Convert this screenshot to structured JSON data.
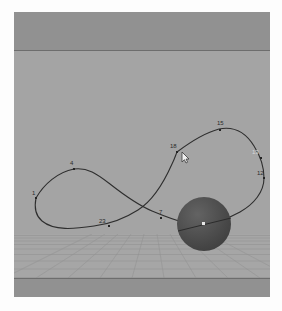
{
  "app": {
    "title": "3D Viewport",
    "view_label": "User Perspective"
  },
  "viewport": {
    "background_color": "#a4a4a4",
    "band_color": "#919191",
    "ground_color": "#a6a6a6",
    "grid_color": "#8e8e8e"
  },
  "objects": {
    "sphere": {
      "name": "sphere-object",
      "color": "#4a4a4a",
      "highlight_color": "#636363",
      "origin_marker": "origin-point",
      "cx": 190,
      "cy": 212,
      "r": 27
    },
    "motion_path": {
      "name": "motion-path-curve",
      "color": "#2e2e2e",
      "width": 1
    }
  },
  "keyframes": [
    {
      "label": "1",
      "x": 22,
      "y": 185,
      "tone": "dark"
    },
    {
      "label": "4",
      "x": 65,
      "y": 158,
      "tone": "dark"
    },
    {
      "label": "23",
      "x": 92,
      "y": 212,
      "tone": "dark"
    },
    {
      "label": "7",
      "x": 148,
      "y": 205,
      "tone": "dark"
    },
    {
      "label": "18",
      "x": 163,
      "y": 139,
      "tone": "dark"
    },
    {
      "label": "15",
      "x": 210,
      "y": 116,
      "tone": "dark"
    },
    {
      "label": "13",
      "x": 245,
      "y": 143,
      "tone": "light"
    },
    {
      "label": "12",
      "x": 251,
      "y": 164,
      "tone": "dark"
    }
  ],
  "cursor": {
    "name": "mouse-pointer",
    "x": 171,
    "y": 142,
    "fill": "#f0f0f0",
    "stroke": "#3a3a3a"
  }
}
